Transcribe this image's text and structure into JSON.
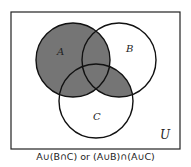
{
  "diagram": {
    "type": "venn",
    "universe_label": "U",
    "sets": [
      {
        "label": "A"
      },
      {
        "label": "B"
      },
      {
        "label": "C"
      }
    ],
    "shaded_region": "A ∪ (B ∩ C)",
    "shade_color": "#757575",
    "caption": "A∪(B∩C) or (A∪B)∩(A∪C)"
  }
}
